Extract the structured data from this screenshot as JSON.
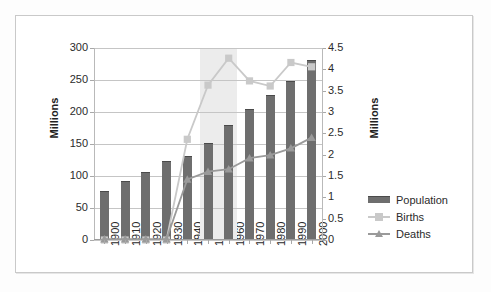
{
  "chart_data": {
    "type": "bar",
    "title": "",
    "subtitle": "",
    "xlabel": "",
    "ylabel": "Millions",
    "ylabel_secondary": "Millions",
    "categories": [
      "1900",
      "1910",
      "1920",
      "1930",
      "1940",
      "1950",
      "1960",
      "1970",
      "1980",
      "1990",
      "2000"
    ],
    "ylim": [
      0,
      300
    ],
    "yticks": [
      "0",
      "50",
      "100",
      "150",
      "200",
      "250",
      "300"
    ],
    "ylim_secondary": [
      0,
      4.5
    ],
    "yticks_secondary": [
      "0",
      "0.5",
      "1",
      "1.5",
      "2",
      "2.5",
      "3",
      "3.5",
      "4",
      "4.5"
    ],
    "grid": true,
    "legend_position": "right",
    "series": [
      {
        "name": "Population",
        "type": "bar",
        "axis": "left",
        "color": "#6e6e6e",
        "values": [
          76,
          92,
          106,
          123,
          132,
          151,
          179,
          204,
          227,
          249,
          281
        ]
      },
      {
        "name": "Births",
        "type": "line",
        "axis": "right",
        "color": "#c9c9c9",
        "marker": "square",
        "values": [
          0,
          0,
          0,
          0,
          2.36,
          3.63,
          4.26,
          3.73,
          3.61,
          4.16,
          4.06
        ]
      },
      {
        "name": "Deaths",
        "type": "line",
        "axis": "right",
        "color": "#9a9a9a",
        "marker": "triangle",
        "values": [
          0.02,
          0.02,
          0.02,
          0.02,
          1.42,
          1.6,
          1.66,
          1.92,
          1.99,
          2.15,
          2.4
        ]
      }
    ],
    "annotations": [
      {
        "kind": "shaded-band",
        "label": "baby-boom-band",
        "x_start": "1946",
        "x_end": "1964",
        "color": "#ececec"
      }
    ]
  },
  "legend": {
    "items": [
      {
        "label": "Population",
        "marker": "bar-swatch",
        "color": "#6e6e6e"
      },
      {
        "label": "Births",
        "marker": "square-marker",
        "color": "#c9c9c9"
      },
      {
        "label": "Deaths",
        "marker": "triangle-marker",
        "color": "#9a9a9a"
      }
    ]
  },
  "axes": {
    "left": {
      "title": "Millions"
    },
    "right": {
      "title": "Millions"
    }
  }
}
